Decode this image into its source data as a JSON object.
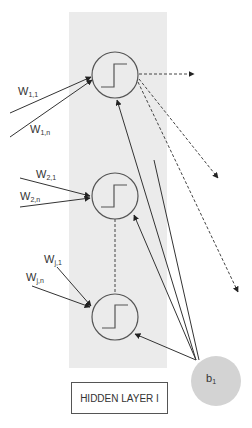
{
  "layer": {
    "label": "HIDDEN LAYER I",
    "panel_color": "#ebebeb"
  },
  "neurons": [
    {
      "id": "neuron-1",
      "activation": "step",
      "inputs": [
        {
          "label_main": "W",
          "label_sub": "1,1"
        },
        {
          "label_main": "W",
          "label_sub": "1,n"
        }
      ]
    },
    {
      "id": "neuron-2",
      "activation": "step",
      "inputs": [
        {
          "label_main": "W",
          "label_sub": "2,1"
        },
        {
          "label_main": "W",
          "label_sub": "2,n"
        }
      ]
    },
    {
      "id": "neuron-j",
      "activation": "step",
      "inputs": [
        {
          "label_main": "W",
          "label_sub": "j,1"
        },
        {
          "label_main": "W",
          "label_sub": "j,n"
        }
      ]
    }
  ],
  "bias": {
    "label_main": "b",
    "label_sub": "1",
    "fill_color": "#d3d3d3"
  },
  "colors": {
    "line": "#333333",
    "circle_stroke": "#555555",
    "dashed": "#444444"
  }
}
